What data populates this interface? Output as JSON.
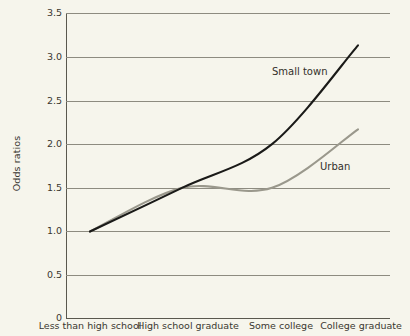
{
  "chart_data": {
    "type": "line",
    "title": "",
    "xlabel": "",
    "ylabel": "Odds ratios",
    "categories": [
      "Less than high school",
      "High school graduate",
      "Some college",
      "College graduate"
    ],
    "series": [
      {
        "name": "Small town",
        "values": [
          1.0,
          1.5,
          2.0,
          3.13
        ],
        "color": "#1a1a18"
      },
      {
        "name": "Urban",
        "values": [
          1.0,
          1.5,
          1.5,
          2.17
        ],
        "color": "#9a988c"
      }
    ],
    "ylim": [
      0,
      3.5
    ],
    "ytick_values": [
      0,
      0.5,
      1.0,
      1.5,
      2.0,
      2.5,
      3.0,
      3.5
    ],
    "ytick_labels": [
      "0",
      "0.5",
      "1.0",
      "1.5",
      "2.0",
      "2.5",
      "3.0",
      "3.5"
    ],
    "grid": true,
    "legend_position": "inline-annotations",
    "annotations": [
      {
        "text": "Small town",
        "series": "Small town"
      },
      {
        "text": "Urban",
        "series": "Urban"
      }
    ]
  },
  "axis": {
    "y_title": "Odds ratios",
    "y_ticks": [
      "3.5",
      "3.0",
      "2.5",
      "2.0",
      "1.5",
      "1.0",
      "0.5",
      "0"
    ],
    "x_ticks": [
      "Less than high school",
      "High school graduate",
      "Some college",
      "College graduate"
    ]
  },
  "labels": {
    "small_town": "Small town",
    "urban": "Urban"
  },
  "colors": {
    "background": "#f6f5ec",
    "small_town_line": "#1a1a18",
    "urban_line": "#9a988c",
    "grid": "#8d8b80",
    "axis": "#5a584e",
    "text": "#3a3730"
  }
}
